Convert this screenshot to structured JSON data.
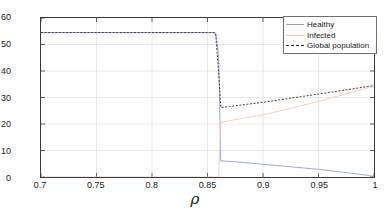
{
  "chart_data": {
    "type": "line",
    "title": "",
    "xlabel": "ρ",
    "ylabel": "Population",
    "xlim": [
      0.7,
      1.0
    ],
    "ylim": [
      0,
      60
    ],
    "xticks": [
      "0.7",
      "0.75",
      "0.8",
      "0.85",
      "0.9",
      "0.95",
      "1"
    ],
    "xtick_values": [
      0.7,
      0.75,
      0.8,
      0.85,
      0.9,
      0.95,
      1.0
    ],
    "yticks": [
      "0",
      "10",
      "20",
      "30",
      "40",
      "50",
      "60"
    ],
    "ytick_values": [
      0,
      10,
      20,
      30,
      40,
      50,
      60
    ],
    "grid": true,
    "legend_position": "top-right",
    "series": [
      {
        "name": "Healthy",
        "color": "#8e9fd0",
        "style": "solid",
        "x": [
          0.7,
          0.85,
          0.8555,
          0.8575,
          0.86,
          0.862,
          0.87,
          0.9,
          0.95,
          0.99,
          1.0
        ],
        "y": [
          54.5,
          54.5,
          54.5,
          54.2,
          46.0,
          6.1,
          5.9,
          4.8,
          2.9,
          0.9,
          0.2
        ]
      },
      {
        "name": "Infected",
        "color": "#f0c8b4",
        "style": "solid",
        "x": [
          0.7,
          0.85,
          0.855,
          0.857,
          0.86,
          0.862,
          0.87,
          0.9,
          0.95,
          1.0
        ],
        "y": [
          0.0,
          0.0,
          0.0,
          0.0,
          0.0,
          20.6,
          21.3,
          23.4,
          28.5,
          34.3
        ]
      },
      {
        "name": "Global population",
        "color": "#2b2b2b",
        "style": "dashed",
        "x": [
          0.7,
          0.85,
          0.856,
          0.8572,
          0.86,
          0.862,
          0.87,
          0.9,
          0.95,
          1.0
        ],
        "y": [
          54.5,
          54.5,
          54.5,
          54.3,
          40.0,
          26.2,
          26.6,
          28.2,
          31.3,
          34.5
        ]
      }
    ]
  },
  "legend": {
    "items": [
      {
        "label": "Healthy",
        "color": "#8e9fd0",
        "style": "solid"
      },
      {
        "label": "Infected",
        "color": "#f0c8b4",
        "style": "solid"
      },
      {
        "label": "Global population",
        "color": "#2b2b2b",
        "style": "dashed"
      }
    ]
  }
}
